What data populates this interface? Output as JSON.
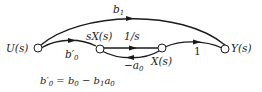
{
  "diagram": {
    "type": "signal-flow-graph",
    "nodes": [
      {
        "id": "U",
        "label": "U(s)"
      },
      {
        "id": "sX",
        "label": "sX(s)"
      },
      {
        "id": "X",
        "label": "X(s)"
      },
      {
        "id": "Y",
        "label": "Y(s)"
      }
    ],
    "edges": [
      {
        "from": "U",
        "to": "Y",
        "gain": "b1"
      },
      {
        "from": "U",
        "to": "sX",
        "gain": "b′0"
      },
      {
        "from": "sX",
        "to": "X",
        "gain": "1/s"
      },
      {
        "from": "X",
        "to": "sX",
        "gain": "−a0"
      },
      {
        "from": "X",
        "to": "Y",
        "gain": "1"
      }
    ],
    "labels": {
      "U": "U(s)",
      "sX": "sX(s)",
      "X": "X(s)",
      "Y": "Y(s)",
      "b1_base": "b",
      "b1_sub": "1",
      "b0p_base": "b′",
      "b0p_sub": "0",
      "inv_s": "1/s",
      "neg_a0_base": "−a",
      "neg_a0_sub": "0",
      "one": "1"
    },
    "equation": {
      "lhs_base": "b′",
      "lhs_sub": "0",
      "eq": " = ",
      "t1_base": "b",
      "t1_sub": "0",
      "minus": " − ",
      "t2_base": "b",
      "t2_sub": "1",
      "t3_base": "a",
      "t3_sub": "0"
    }
  }
}
